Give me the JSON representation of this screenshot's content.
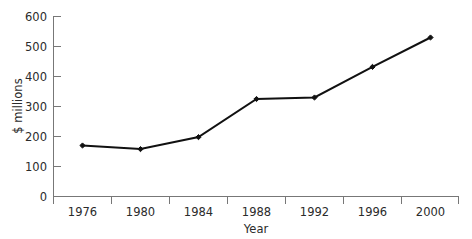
{
  "chart_data": {
    "type": "line",
    "title": "",
    "subtitle": "",
    "xlabel": "Year",
    "ylabel": "$ millions",
    "categories": [
      "1976",
      "1980",
      "1984",
      "1988",
      "1992",
      "1996",
      "2000"
    ],
    "values": [
      170,
      158,
      198,
      325,
      330,
      432,
      530
    ],
    "series": [
      {
        "name": "",
        "values": [
          170,
          158,
          198,
          325,
          330,
          432,
          530
        ]
      }
    ],
    "x_tick_labels": [
      "1976",
      "1980",
      "1984",
      "1988",
      "1992",
      "1996",
      "2000"
    ],
    "y_tick_labels": [
      "0",
      "100",
      "200",
      "300",
      "400",
      "500",
      "600"
    ],
    "y_ticks": [
      0,
      100,
      200,
      300,
      400,
      500,
      600
    ],
    "ylim": [
      0,
      600
    ],
    "grid": false,
    "legend": false,
    "legend_position": "none",
    "marker": "diamond",
    "line_color": "#111111",
    "axis_color": "#777777",
    "text_color": "#2b2b2b",
    "background_color": "#ffffff",
    "x_axis_label_placement": "between-ticks"
  },
  "axis": {
    "y_title": "$ millions",
    "x_title": "Year"
  }
}
